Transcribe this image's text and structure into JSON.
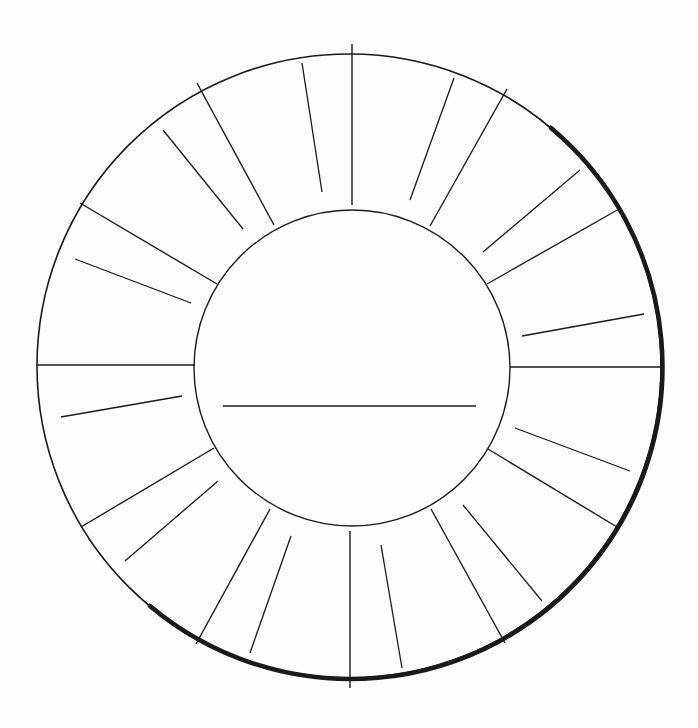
{
  "diagram": {
    "type": "blank-wheel-worksheet",
    "canvas": {
      "width": 698,
      "height": 728,
      "background": "#fdfdfd"
    },
    "stroke_color": "#1a1a1a",
    "outer_circle": {
      "cx": 349,
      "cy": 366,
      "r": 312,
      "stroke_width": 1.6
    },
    "shadow_arc": {
      "stroke_width": 4.5
    },
    "inner_circle": {
      "cx": 352,
      "cy": 368,
      "r": 158,
      "stroke_width": 1.4
    },
    "center_line": {
      "x1": 223,
      "y1": 406,
      "x2": 476,
      "y2": 406
    },
    "segment_count": 12,
    "dividers": [
      {
        "x1": 352,
        "y1": 44,
        "x2": 352,
        "y2": 205
      },
      {
        "x1": 507,
        "y1": 89,
        "x2": 430,
        "y2": 226
      },
      {
        "x1": 619,
        "y1": 209,
        "x2": 487,
        "y2": 284
      },
      {
        "x1": 661,
        "y1": 367,
        "x2": 510,
        "y2": 367
      },
      {
        "x1": 617,
        "y1": 527,
        "x2": 488,
        "y2": 449
      },
      {
        "x1": 505,
        "y1": 643,
        "x2": 431,
        "y2": 509
      },
      {
        "x1": 350,
        "y1": 688,
        "x2": 350,
        "y2": 531
      },
      {
        "x1": 196,
        "y1": 644,
        "x2": 270,
        "y2": 509
      },
      {
        "x1": 81,
        "y1": 527,
        "x2": 214,
        "y2": 448
      },
      {
        "x1": 37,
        "y1": 365,
        "x2": 195,
        "y2": 365
      },
      {
        "x1": 80,
        "y1": 203,
        "x2": 217,
        "y2": 284
      },
      {
        "x1": 197,
        "y1": 83,
        "x2": 274,
        "y2": 225
      }
    ],
    "writing_lines": [
      {
        "x1": 302,
        "y1": 63,
        "x2": 322,
        "y2": 192
      },
      {
        "x1": 454,
        "y1": 78,
        "x2": 410,
        "y2": 200
      },
      {
        "x1": 580,
        "y1": 170,
        "x2": 483,
        "y2": 252
      },
      {
        "x1": 644,
        "y1": 314,
        "x2": 522,
        "y2": 336
      },
      {
        "x1": 630,
        "y1": 471,
        "x2": 515,
        "y2": 428
      },
      {
        "x1": 542,
        "y1": 601,
        "x2": 463,
        "y2": 505
      },
      {
        "x1": 402,
        "y1": 668,
        "x2": 381,
        "y2": 545
      },
      {
        "x1": 250,
        "y1": 653,
        "x2": 291,
        "y2": 536
      },
      {
        "x1": 125,
        "y1": 561,
        "x2": 218,
        "y2": 481
      },
      {
        "x1": 61,
        "y1": 417,
        "x2": 182,
        "y2": 396
      },
      {
        "x1": 75,
        "y1": 259,
        "x2": 191,
        "y2": 303
      },
      {
        "x1": 163,
        "y1": 130,
        "x2": 243,
        "y2": 229
      }
    ]
  }
}
